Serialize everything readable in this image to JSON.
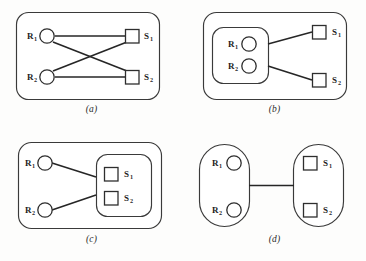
{
  "figure": {
    "background_color": "#fdfdfc",
    "stroke_color": "#3a3a3a",
    "edge_color": "#262626",
    "node_fill": "#ffffff",
    "label_color": "#1f1f1f"
  },
  "panels": [
    {
      "id": "a",
      "caption": "(a)",
      "description": "flat bipartite graph, all receivers connected to all senders",
      "has_outer_box": true,
      "grouping": "none",
      "nodes": [
        {
          "name": "R1",
          "base": "R",
          "sub": "1",
          "shape": "circle",
          "side": "left",
          "label_position": "left"
        },
        {
          "name": "R2",
          "base": "R",
          "sub": "2",
          "shape": "circle",
          "side": "left",
          "label_position": "left"
        },
        {
          "name": "S1",
          "base": "S",
          "sub": "1",
          "shape": "square",
          "side": "right",
          "label_position": "right"
        },
        {
          "name": "S2",
          "base": "S",
          "sub": "2",
          "shape": "square",
          "side": "right",
          "label_position": "right"
        }
      ],
      "edges": [
        {
          "from": "R1",
          "to": "S1"
        },
        {
          "from": "R1",
          "to": "S2"
        },
        {
          "from": "R2",
          "to": "S1"
        },
        {
          "from": "R2",
          "to": "S2"
        }
      ]
    },
    {
      "id": "b",
      "caption": "(b)",
      "description": "receivers grouped in one container, two edges to separate senders",
      "has_outer_box": true,
      "grouping": "receivers",
      "nodes": [
        {
          "name": "R1",
          "base": "R",
          "sub": "1",
          "shape": "circle",
          "side": "left",
          "label_position": "left"
        },
        {
          "name": "R2",
          "base": "R",
          "sub": "2",
          "shape": "circle",
          "side": "left",
          "label_position": "left"
        },
        {
          "name": "S1",
          "base": "S",
          "sub": "1",
          "shape": "square",
          "side": "right",
          "label_position": "right"
        },
        {
          "name": "S2",
          "base": "S",
          "sub": "2",
          "shape": "square",
          "side": "right",
          "label_position": "right"
        }
      ],
      "edges": [
        {
          "from": "R-group",
          "to": "S1"
        },
        {
          "from": "R-group",
          "to": "S2"
        }
      ]
    },
    {
      "id": "c",
      "caption": "(c)",
      "description": "senders grouped in one container, two edges from separate receivers",
      "has_outer_box": true,
      "grouping": "senders",
      "nodes": [
        {
          "name": "R1",
          "base": "R",
          "sub": "1",
          "shape": "circle",
          "side": "left",
          "label_position": "left"
        },
        {
          "name": "R2",
          "base": "R",
          "sub": "2",
          "shape": "circle",
          "side": "left",
          "label_position": "left"
        },
        {
          "name": "S1",
          "base": "S",
          "sub": "1",
          "shape": "square",
          "side": "right",
          "label_position": "right"
        },
        {
          "name": "S2",
          "base": "S",
          "sub": "2",
          "shape": "square",
          "side": "right",
          "label_position": "right"
        }
      ],
      "edges": [
        {
          "from": "R1",
          "to": "S-group"
        },
        {
          "from": "R2",
          "to": "S-group"
        }
      ]
    },
    {
      "id": "d",
      "caption": "(d)",
      "description": "both sides grouped in stadium containers joined by a single edge, no outer box",
      "has_outer_box": false,
      "grouping": "both",
      "nodes": [
        {
          "name": "R1",
          "base": "R",
          "sub": "1",
          "shape": "circle",
          "side": "left",
          "label_position": "left"
        },
        {
          "name": "R2",
          "base": "R",
          "sub": "2",
          "shape": "circle",
          "side": "left",
          "label_position": "left"
        },
        {
          "name": "S1",
          "base": "S",
          "sub": "1",
          "shape": "square",
          "side": "right",
          "label_position": "right"
        },
        {
          "name": "S2",
          "base": "S",
          "sub": "2",
          "shape": "square",
          "side": "right",
          "label_position": "right"
        }
      ],
      "edges": [
        {
          "from": "R-group",
          "to": "S-group"
        }
      ]
    }
  ]
}
